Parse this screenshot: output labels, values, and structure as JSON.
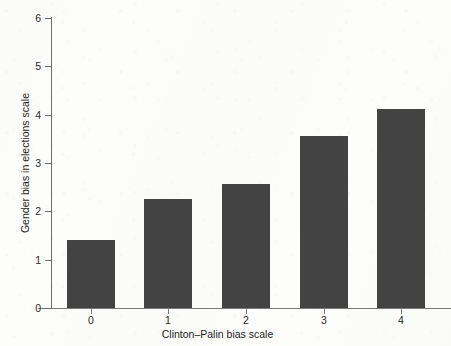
{
  "chart_data": {
    "type": "bar",
    "title": "",
    "subtitle": "",
    "xlabel": "Clinton–Palin bias scale",
    "ylabel": "Gender bias in elections scale",
    "categories": [
      "0",
      "1",
      "2",
      "3",
      "4"
    ],
    "values": [
      1.41,
      2.26,
      2.57,
      3.56,
      4.11
    ],
    "series": [
      {
        "name": "Gender bias in elections scale",
        "values": [
          1.41,
          2.26,
          2.57,
          3.56,
          4.11
        ]
      }
    ],
    "ylim": [
      0,
      6
    ],
    "y_ticks": [
      "0",
      "1",
      "2",
      "3",
      "4",
      "5",
      "6"
    ],
    "y_tick_values": [
      0,
      1,
      2,
      3,
      4,
      5,
      6
    ],
    "x_ticks": [
      "0",
      "1",
      "2",
      "3",
      "4"
    ],
    "grid": false,
    "legend": false,
    "legend_position": "none",
    "bar_color": "#434343",
    "axis_color": "#6e6e6e",
    "background_color": "#fdfdfc",
    "annotations": []
  },
  "figure": {
    "axis_title_x": "Clinton–Palin bias scale",
    "axis_title_y": "Gender bias in elections scale"
  }
}
